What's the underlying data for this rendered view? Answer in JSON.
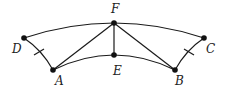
{
  "diagram": {
    "points": [
      {
        "id": "F",
        "label": "F",
        "x": 114,
        "y": 23,
        "lx": 115,
        "ly": 13
      },
      {
        "id": "E",
        "label": "E",
        "x": 114,
        "y": 55,
        "lx": 117,
        "ly": 74
      },
      {
        "id": "D",
        "label": "D",
        "x": 24,
        "y": 38,
        "lx": 18,
        "ly": 53
      },
      {
        "id": "A",
        "label": "A",
        "x": 53,
        "y": 70,
        "lx": 59,
        "ly": 84
      },
      {
        "id": "B",
        "label": "B",
        "x": 175,
        "y": 70,
        "lx": 179,
        "ly": 84
      },
      {
        "id": "C",
        "label": "C",
        "x": 204,
        "y": 38,
        "lx": 210,
        "ly": 53
      }
    ],
    "arcs": [
      {
        "name": "outer-arc-D-F-C",
        "from": "D",
        "through": "F",
        "to": "C"
      },
      {
        "name": "inner-arc-A-E-B",
        "from": "A",
        "through": "E",
        "to": "B"
      },
      {
        "name": "arc-D-A",
        "from": "D",
        "to": "A",
        "tick": true
      },
      {
        "name": "arc-C-B",
        "from": "C",
        "to": "B",
        "tick": true
      }
    ],
    "segments": [
      {
        "name": "segment-F-A",
        "from": "F",
        "to": "A"
      },
      {
        "name": "segment-F-E",
        "from": "F",
        "to": "E"
      },
      {
        "name": "segment-F-B",
        "from": "F",
        "to": "B"
      }
    ],
    "labels": {
      "F": "F",
      "E": "E",
      "D": "D",
      "A": "A",
      "B": "B",
      "C": "C"
    }
  }
}
